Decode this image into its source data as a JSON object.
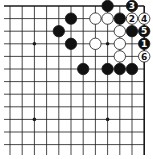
{
  "diagram": {
    "type": "go-board-fragment",
    "view": "top-right corner",
    "columns_visible": 12,
    "rows_visible": 12,
    "grid": {
      "x0": 10,
      "dx": 12.2,
      "y0": 6,
      "dy": 12.6,
      "top_edge": true,
      "right_edge": true
    },
    "colors": {
      "line": "#1a1a1a",
      "black_stone": "#111111",
      "white_stone": "#ffffff",
      "label_on_black": "#ffffff",
      "label_on_white": "#111111"
    },
    "star_points": [
      [
        2,
        3
      ],
      [
        8,
        3
      ],
      [
        2,
        9
      ],
      [
        8,
        9
      ]
    ],
    "stones": [
      {
        "c": 8,
        "r": 0,
        "color": "black",
        "label": ""
      },
      {
        "c": 10,
        "r": 0,
        "color": "black",
        "label": "3"
      },
      {
        "c": 5,
        "r": 1,
        "color": "black",
        "label": ""
      },
      {
        "c": 7,
        "r": 1,
        "color": "white",
        "label": ""
      },
      {
        "c": 8,
        "r": 1,
        "color": "white",
        "label": ""
      },
      {
        "c": 9,
        "r": 1,
        "color": "black",
        "label": ""
      },
      {
        "c": 10,
        "r": 1,
        "color": "white",
        "label": "2"
      },
      {
        "c": 11,
        "r": 1,
        "color": "white",
        "label": "4"
      },
      {
        "c": 4,
        "r": 2,
        "color": "black",
        "label": ""
      },
      {
        "c": 9,
        "r": 2,
        "color": "white",
        "label": ""
      },
      {
        "c": 10,
        "r": 2,
        "color": "black",
        "label": ""
      },
      {
        "c": 11,
        "r": 2,
        "color": "black",
        "label": "5"
      },
      {
        "c": 5,
        "r": 3,
        "color": "black",
        "label": ""
      },
      {
        "c": 7,
        "r": 3,
        "color": "white",
        "label": ""
      },
      {
        "c": 9,
        "r": 3,
        "color": "white",
        "label": ""
      },
      {
        "c": 11,
        "r": 3,
        "color": "black",
        "label": "1"
      },
      {
        "c": 9,
        "r": 4,
        "color": "white",
        "label": ""
      },
      {
        "c": 11,
        "r": 4,
        "color": "white",
        "label": "6"
      },
      {
        "c": 6,
        "r": 5,
        "color": "black",
        "label": ""
      },
      {
        "c": 8,
        "r": 5,
        "color": "black",
        "label": ""
      },
      {
        "c": 9,
        "r": 5,
        "color": "black",
        "label": ""
      },
      {
        "c": 10,
        "r": 5,
        "color": "black",
        "label": ""
      }
    ]
  }
}
